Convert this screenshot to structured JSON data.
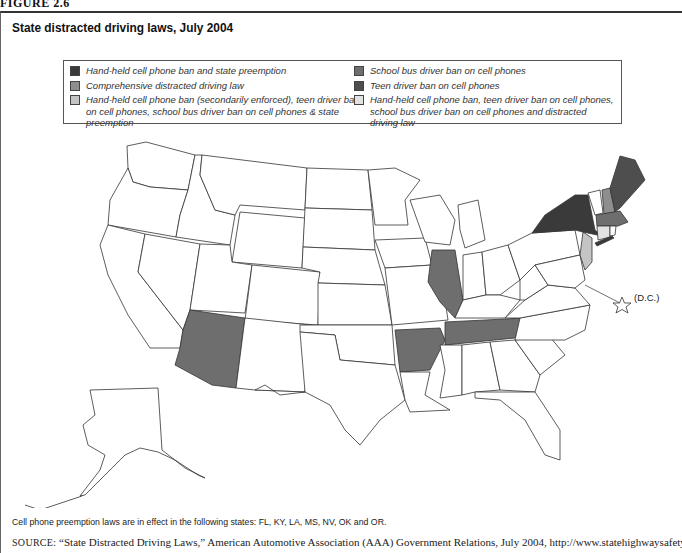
{
  "figure_label": "FIGURE 2.6",
  "title": "State distracted driving laws, July 2004",
  "legend": {
    "items": [
      {
        "key": "handheld_preemption",
        "label": "Hand-held cell phone ban and state preemption",
        "color": "#3a3a3a"
      },
      {
        "key": "comprehensive",
        "label": "Comprehensive distracted driving law",
        "color": "#8e8e8e"
      },
      {
        "key": "handheld_secondary",
        "label": "Hand-held cell phone ban (secondarily enforced), teen driver ban on cell phones, school bus driver ban on cell phones & state preemption",
        "color": "#c4c4c4"
      },
      {
        "key": "school_bus",
        "label": "School bus driver ban on cell phones",
        "color": "#6e6e6e"
      },
      {
        "key": "teen_driver",
        "label": "Teen driver ban on cell phones",
        "color": "#4e4e4e"
      },
      {
        "key": "combined_all",
        "label": "Hand-held cell phone ban, teen driver ban on cell phones, school bus driver ban on cell phones and distracted driving law",
        "color": "#e2e2e2"
      }
    ]
  },
  "map": {
    "states": {
      "NY": "handheld_preemption",
      "NH": "comprehensive",
      "MA": "school_bus",
      "ME": "teen_driver",
      "AZ": "school_bus",
      "AR": "school_bus",
      "TN": "school_bus",
      "IL": "school_bus",
      "NJ": "handheld_secondary",
      "CT": "combined_all"
    },
    "dc_label": "(D.C.)"
  },
  "note": "Cell phone preemption laws are in effect in the following states: FL, KY, LA, MS, NV, OK and OR.",
  "source": {
    "prefix": "SOURCE:",
    "text": " “State Distracted Driving Laws,” American Automotive Association (AAA) Government Relations, July 2004, http://www.statehighwaysafety.org/"
  }
}
